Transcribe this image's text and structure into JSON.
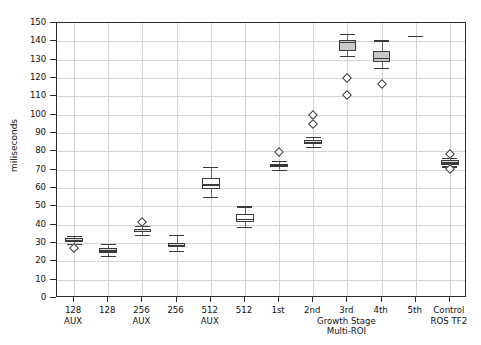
{
  "chart_data": {
    "type": "box",
    "title": "",
    "xlabel": "",
    "ylabel": "miliseconds",
    "ylim": [
      0,
      150
    ],
    "ytick_step": 10,
    "yticks": [
      0,
      10,
      20,
      30,
      40,
      50,
      60,
      70,
      80,
      90,
      100,
      110,
      120,
      130,
      140,
      150
    ],
    "grid": true,
    "legend": "none",
    "categories": [
      "128 AUX",
      "128",
      "256 AUX",
      "256",
      "512 AUX",
      "512",
      "1st",
      "2nd",
      "3rd",
      "4th",
      "5th",
      "Control"
    ],
    "group_labels": [
      {
        "text": "AUX",
        "under": "128 AUX"
      },
      {
        "text": "AUX",
        "under": "256 AUX"
      },
      {
        "text": "AUX",
        "under": "512 AUX"
      },
      {
        "text": "Growth Stage",
        "under": "3rd"
      },
      {
        "text": "Multi-ROI",
        "under": "3rd"
      },
      {
        "text": "ROS TF2",
        "under": "Control"
      }
    ],
    "boxes": [
      {
        "label": "128 AUX",
        "whisker_low": 29.5,
        "q1": 30.3,
        "median": 31.6,
        "q3": 32.6,
        "whisker_high": 34.0,
        "fliers": [
          27.3
        ],
        "fill": "#d9d9d9"
      },
      {
        "label": "128",
        "whisker_low": 22.8,
        "q1": 24.6,
        "median": 26.0,
        "q3": 27.2,
        "whisker_high": 29.3,
        "fliers": [],
        "fill": "#d9d9d9"
      },
      {
        "label": "256 AUX",
        "whisker_low": 34.6,
        "q1": 35.8,
        "median": 36.6,
        "q3": 37.8,
        "whisker_high": 39.2,
        "fliers": [
          41.2
        ],
        "fill": "#d9d9d9"
      },
      {
        "label": "256",
        "whisker_low": 25.6,
        "q1": 27.6,
        "median": 29.0,
        "q3": 30.2,
        "whisker_high": 34.2,
        "fliers": [],
        "fill": "#d9d9d9"
      },
      {
        "label": "512 AUX",
        "whisker_low": 55.0,
        "q1": 59.5,
        "median": 62.0,
        "q3": 65.5,
        "whisker_high": 71.5,
        "fliers": [],
        "fill": "#ffffff"
      },
      {
        "label": "512",
        "whisker_low": 38.6,
        "q1": 41.5,
        "median": 43.2,
        "q3": 45.6,
        "whisker_high": 50.0,
        "fliers": [],
        "fill": "#ffffff"
      },
      {
        "label": "1st",
        "whisker_low": 70.0,
        "q1": 71.3,
        "median": 72.3,
        "q3": 73.2,
        "whisker_high": 75.0,
        "fliers": [
          79.8
        ],
        "fill": "#d9d9d9"
      },
      {
        "label": "2nd",
        "whisker_low": 82.6,
        "q1": 84.0,
        "median": 85.2,
        "q3": 86.3,
        "whisker_high": 88.0,
        "fliers": [
          95.0,
          100.0
        ],
        "fill": "#d9d9d9"
      },
      {
        "label": "3rd",
        "whisker_low": 132.0,
        "q1": 134.5,
        "median": 139.5,
        "q3": 140.5,
        "whisker_high": 144.0,
        "fliers": [
          110.5,
          120.0
        ],
        "fill": "#c9c9c9"
      },
      {
        "label": "4th",
        "whisker_low": 125.5,
        "q1": 128.5,
        "median": 131.0,
        "q3": 134.5,
        "whisker_high": 140.5,
        "fliers": [
          117.0
        ],
        "fill": "#c9c9c9"
      },
      {
        "label": "5th",
        "whisker_low": 143.0,
        "q1": 143.0,
        "median": 143.0,
        "q3": 143.0,
        "whisker_high": 143.0,
        "fliers": [],
        "fill": "#ffffff"
      },
      {
        "label": "Control",
        "whisker_low": 71.8,
        "q1": 72.8,
        "median": 74.0,
        "q3": 75.2,
        "whisker_high": 76.5,
        "fliers": [
          78.5,
          70.5
        ],
        "fill": "#d9d9d9"
      }
    ]
  },
  "style": {
    "grid_color": "#d3d3d8",
    "frame_color": "#2b2b2b",
    "box_edge": "#3a3a3a",
    "background": "#ffffff"
  }
}
